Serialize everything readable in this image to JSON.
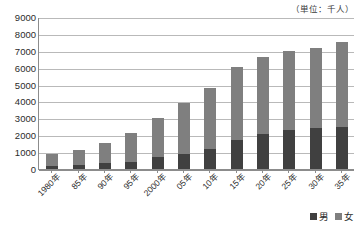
{
  "unit_caption": "（単位：千人）",
  "legend": {
    "position": "bottom-right",
    "items": [
      {
        "label": "男",
        "color": "#404040"
      },
      {
        "label": "女",
        "color": "#7f7f7f"
      }
    ]
  },
  "colors": {
    "male": "#404040",
    "female": "#7f7f7f",
    "gridline": "#b9b9b9",
    "axis": "#8c8c8c",
    "background": "#ffffff",
    "text": "#2b2b2b"
  },
  "chart_data": {
    "type": "bar",
    "stacked": true,
    "title": "",
    "subtitle": "",
    "xlabel": "",
    "ylabel": "",
    "unit": "千人",
    "ylim": [
      0,
      9000
    ],
    "ytick_step": 1000,
    "yticks": [
      0,
      1000,
      2000,
      3000,
      4000,
      5000,
      6000,
      7000,
      8000,
      9000
    ],
    "ytick_labels": [
      "0",
      "1000",
      "2000",
      "3000",
      "4000",
      "5000",
      "6000",
      "7000",
      "8000",
      "9000"
    ],
    "grid": true,
    "grid_axis": "y",
    "legend_position": "bottom-right",
    "categories": [
      "1980年",
      "85年",
      "90年",
      "95年",
      "2000年",
      "05年",
      "10年",
      "15年",
      "20年",
      "25年",
      "30年",
      "35年"
    ],
    "series": [
      {
        "name": "男",
        "color": "#404040",
        "values": [
          190,
          260,
          350,
          400,
          700,
          900,
          1200,
          1700,
          2100,
          2300,
          2400,
          2500
        ]
      },
      {
        "name": "女",
        "color": "#7f7f7f",
        "values": [
          670,
          870,
          1170,
          1730,
          2300,
          3000,
          3600,
          4350,
          4550,
          4700,
          4750,
          5000
        ]
      }
    ],
    "totals": [
      860,
      1130,
      1520,
      2130,
      3000,
      3900,
      4800,
      6050,
      6650,
      7000,
      7150,
      7500
    ]
  }
}
